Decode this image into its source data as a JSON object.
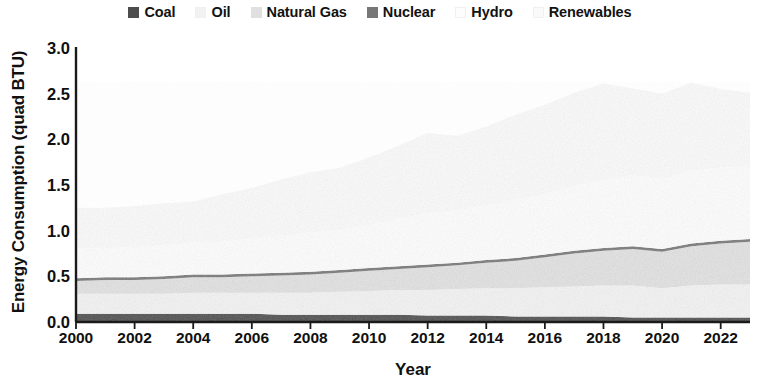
{
  "chart_data": {
    "type": "area",
    "stacked": true,
    "title": "",
    "xlabel": "Year",
    "ylabel": "Energy Consumption (quad BTU)",
    "xlim": [
      2000,
      2023
    ],
    "ylim": [
      0.0,
      3.0
    ],
    "yticks": [
      "0.0",
      "0.5",
      "1.0",
      "1.5",
      "2.0",
      "2.5",
      "3.0"
    ],
    "ytick_values": [
      0.0,
      0.5,
      1.0,
      1.5,
      2.0,
      2.5,
      3.0
    ],
    "xticks": [
      "2000",
      "2002",
      "2004",
      "2006",
      "2008",
      "2010",
      "2012",
      "2014",
      "2016",
      "2018",
      "2020",
      "2022"
    ],
    "xtick_values": [
      2000,
      2002,
      2004,
      2006,
      2008,
      2010,
      2012,
      2014,
      2016,
      2018,
      2020,
      2022
    ],
    "grid": false,
    "legend_position": "top-center",
    "x": [
      2000,
      2001,
      2002,
      2003,
      2004,
      2005,
      2006,
      2007,
      2008,
      2009,
      2010,
      2011,
      2012,
      2013,
      2014,
      2015,
      2016,
      2017,
      2018,
      2019,
      2020,
      2021,
      2022,
      2023
    ],
    "series": [
      {
        "name": "Coal",
        "color": "#4d4d4d",
        "values": [
          0.09,
          0.09,
          0.09,
          0.09,
          0.09,
          0.09,
          0.09,
          0.08,
          0.08,
          0.08,
          0.08,
          0.08,
          0.07,
          0.07,
          0.07,
          0.06,
          0.06,
          0.06,
          0.06,
          0.05,
          0.05,
          0.05,
          0.05,
          0.05
        ]
      },
      {
        "name": "Oil",
        "color": "#f2f2f2",
        "values": [
          0.22,
          0.22,
          0.22,
          0.22,
          0.23,
          0.23,
          0.23,
          0.24,
          0.24,
          0.25,
          0.26,
          0.27,
          0.28,
          0.29,
          0.3,
          0.31,
          0.32,
          0.33,
          0.34,
          0.35,
          0.32,
          0.35,
          0.36,
          0.36
        ]
      },
      {
        "name": "Natural Gas",
        "color": "#e0e0e0",
        "values": [
          0.14,
          0.15,
          0.15,
          0.16,
          0.17,
          0.17,
          0.18,
          0.19,
          0.2,
          0.21,
          0.22,
          0.23,
          0.25,
          0.26,
          0.28,
          0.3,
          0.33,
          0.36,
          0.38,
          0.4,
          0.4,
          0.43,
          0.45,
          0.47
        ]
      },
      {
        "name": "Nuclear",
        "color": "#777777",
        "values": [
          0.03,
          0.03,
          0.03,
          0.03,
          0.03,
          0.03,
          0.03,
          0.03,
          0.03,
          0.03,
          0.03,
          0.03,
          0.03,
          0.03,
          0.03,
          0.03,
          0.03,
          0.03,
          0.03,
          0.03,
          0.03,
          0.03,
          0.03,
          0.03
        ]
      },
      {
        "name": "Hydro",
        "color": "#fdfdfd",
        "values": [
          0.33,
          0.32,
          0.33,
          0.34,
          0.35,
          0.36,
          0.38,
          0.4,
          0.43,
          0.44,
          0.47,
          0.52,
          0.56,
          0.57,
          0.6,
          0.63,
          0.66,
          0.71,
          0.74,
          0.78,
          0.76,
          0.8,
          0.8,
          0.8
        ]
      },
      {
        "name": "Renewables",
        "color": "#fafafa",
        "values": [
          0.44,
          0.44,
          0.45,
          0.46,
          0.45,
          0.52,
          0.56,
          0.62,
          0.66,
          0.68,
          0.74,
          0.8,
          0.88,
          0.82,
          0.86,
          0.94,
          0.98,
          1.02,
          1.06,
          0.95,
          0.94,
          0.96,
          0.86,
          0.8
        ]
      }
    ],
    "stack_totals": [
      1.25,
      1.25,
      1.27,
      1.3,
      1.32,
      1.4,
      1.47,
      1.56,
      1.64,
      1.69,
      1.8,
      1.93,
      2.07,
      1.99,
      2.14,
      2.27,
      2.38,
      2.51,
      2.61,
      2.56,
      2.5,
      2.62,
      2.55,
      2.51
    ]
  },
  "legend": {
    "entries": [
      {
        "label": "Coal"
      },
      {
        "label": "Oil"
      },
      {
        "label": "Natural Gas"
      },
      {
        "label": "Nuclear"
      },
      {
        "label": "Hydro"
      },
      {
        "label": "Renewables"
      }
    ]
  }
}
